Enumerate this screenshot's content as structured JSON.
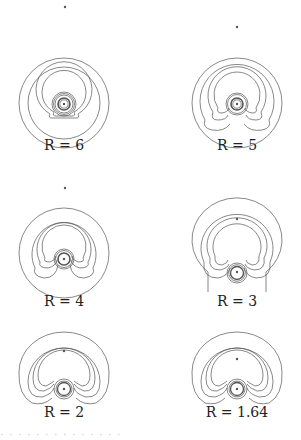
{
  "figure": {
    "layout": "3 rows x 2 columns of contour-line plots",
    "line_color": "#555555",
    "panels": [
      {
        "label": "R = 6",
        "var": "R",
        "value": "6"
      },
      {
        "label": "R = 5",
        "var": "R",
        "value": "5"
      },
      {
        "label": "R = 4",
        "var": "R",
        "value": "4"
      },
      {
        "label": "R = 3",
        "var": "R",
        "value": "3"
      },
      {
        "label": "R = 2",
        "var": "R",
        "value": "2"
      },
      {
        "label": "R = 1.64",
        "var": "R",
        "value": "1.64"
      }
    ],
    "caption_fragment": "· · ·  ·  ·   ·  ·   ·  ·    ·  ·   ·  ·  ·"
  }
}
